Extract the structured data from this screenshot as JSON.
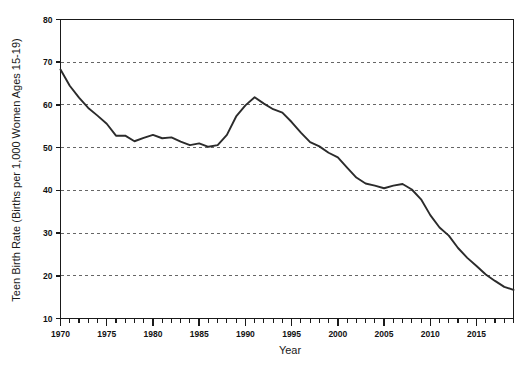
{
  "chart_data": {
    "type": "line",
    "title": "",
    "xlabel": "Year",
    "ylabel": "Teen Birth Rate (Births per 1,000 Women Ages 15-19)",
    "xlim": [
      1970,
      2019
    ],
    "ylim": [
      10,
      80
    ],
    "grid": true,
    "legend": null,
    "y_ticks": [
      10,
      20,
      30,
      40,
      50,
      60,
      70,
      80
    ],
    "y_tick_labels": [
      "10",
      "20",
      "30",
      "40",
      "50",
      "60",
      "70",
      "80"
    ],
    "x_ticks": [
      1970,
      1975,
      1980,
      1985,
      1990,
      1995,
      2000,
      2005,
      2010,
      2015
    ],
    "x_tick_labels": [
      "1970",
      "1975",
      "1980",
      "1985",
      "1990",
      "1995",
      "2000",
      "2005",
      "2010",
      "2015"
    ],
    "x_minor_tick_step": 1,
    "line_color": "#2b2b2b",
    "series": [
      {
        "name": "Teen Birth Rate",
        "x": [
          1970,
          1971,
          1972,
          1973,
          1974,
          1975,
          1976,
          1977,
          1978,
          1979,
          1980,
          1981,
          1982,
          1983,
          1984,
          1985,
          1986,
          1987,
          1988,
          1989,
          1990,
          1991,
          1992,
          1993,
          1994,
          1995,
          1996,
          1997,
          1998,
          1999,
          2000,
          2001,
          2002,
          2003,
          2004,
          2005,
          2006,
          2007,
          2008,
          2009,
          2010,
          2011,
          2012,
          2013,
          2014,
          2015,
          2016,
          2017,
          2018,
          2019
        ],
        "values": [
          68.3,
          64.5,
          61.7,
          59.3,
          57.5,
          55.6,
          52.8,
          52.8,
          51.5,
          52.3,
          53.0,
          52.2,
          52.4,
          51.4,
          50.6,
          51.0,
          50.2,
          50.6,
          53.0,
          57.3,
          59.9,
          61.8,
          60.3,
          59.0,
          58.2,
          56.0,
          53.5,
          51.3,
          50.3,
          48.8,
          47.7,
          45.3,
          43.0,
          41.6,
          41.1,
          40.5,
          41.1,
          41.5,
          40.2,
          37.9,
          34.2,
          31.3,
          29.4,
          26.5,
          24.2,
          22.3,
          20.3,
          18.8,
          17.4,
          16.7
        ]
      }
    ]
  },
  "axis_labels": {
    "x_title": "Year",
    "y_title": "Teen Birth Rate (Births per 1,000 Women Ages 15-19)"
  }
}
